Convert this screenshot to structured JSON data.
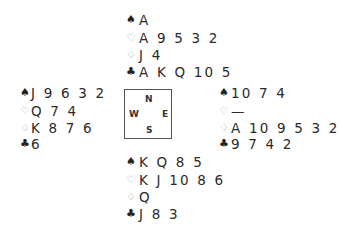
{
  "hands": {
    "north": {
      "spades": "A",
      "hearts": "A 9 5 3 2",
      "diamonds": "J 4",
      "clubs": "A K Q 10 5"
    },
    "west": {
      "spades": "J 9 6 3 2",
      "hearts": "Q 7 4",
      "diamonds": "K 8 7 6",
      "clubs": "6"
    },
    "east": {
      "spades": "10 7 4",
      "hearts": "—",
      "diamonds": "A 10 9 5 3 2",
      "clubs": "9 7 4 2"
    },
    "south": {
      "spades": "K Q 8 5",
      "hearts": "K J 10 8 6",
      "diamonds": "Q",
      "clubs": "J 8 3"
    }
  },
  "suit_symbols": {
    "spades": "♠",
    "hearts": "♡",
    "diamonds": "♢",
    "clubs": "♣"
  },
  "compass": {
    "north": "N",
    "west": "W",
    "east": "E",
    "south": "S"
  }
}
